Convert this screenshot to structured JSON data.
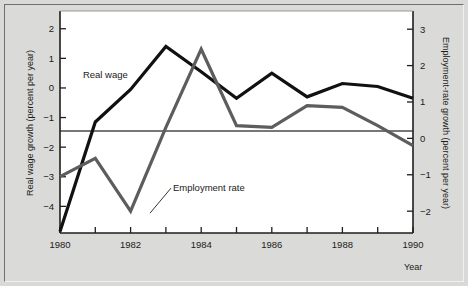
{
  "chart_data": {
    "type": "line",
    "title": "",
    "xlabel": "Year",
    "ylabel_left": "Real wage growth (percent per year)",
    "ylabel_right": "Employment-rate growth (percent per year)",
    "x": [
      1980,
      1981,
      1982,
      1983,
      1984,
      1985,
      1986,
      1987,
      1988,
      1989,
      1990
    ],
    "xlim": [
      1980,
      1990
    ],
    "xticks": [
      1980,
      1981,
      1982,
      1983,
      1984,
      1985,
      1986,
      1987,
      1988,
      1989,
      1990
    ],
    "xticklabels": [
      "1980",
      "",
      "1982",
      "",
      "1984",
      "",
      "1986",
      "",
      "1988",
      "",
      "1990"
    ],
    "ylim_left": [
      -4.9,
      2.6
    ],
    "yticks_left": [
      -4,
      -3,
      -2,
      -1,
      0,
      1,
      2
    ],
    "yticklabels_left": [
      "−4",
      "−3",
      "−2",
      "−1",
      "0",
      "1",
      "2"
    ],
    "ylim_right": [
      -2.6,
      3.5
    ],
    "yticks_right": [
      -2,
      -1,
      0,
      1,
      2,
      3
    ],
    "yticklabels_right": [
      "−2",
      "−1",
      "0",
      "1",
      "2",
      "3"
    ],
    "grid": false,
    "legend_position": "inline-annotations",
    "zero_reference_line": 0,
    "series": [
      {
        "name": "Real wage",
        "axis": "left",
        "color": "#111111",
        "width": 3.2,
        "label_x": 1980.65,
        "label_y_left": 0.35,
        "values": [
          -4.85,
          -1.15,
          -0.05,
          1.4,
          0.55,
          -0.35,
          0.5,
          -0.3,
          0.15,
          0.05,
          -0.35
        ]
      },
      {
        "name": "Employment rate",
        "axis": "right",
        "color": "#5d5d5d",
        "width": 3.2,
        "label_x": 1983.2,
        "label_y_right": -1.45,
        "values": [
          -1.05,
          -0.55,
          -2.0,
          0.3,
          2.45,
          0.35,
          0.3,
          0.9,
          0.85,
          0.35,
          -0.2
        ]
      }
    ],
    "annotations": [
      {
        "text": "Real wage",
        "target_x": 1981.6,
        "target_y_left": -0.45
      },
      {
        "text": "Employment rate",
        "target_x": 1982.55,
        "target_y_right": -2.0
      }
    ]
  },
  "figure": {
    "background_color": "#d9d9d7",
    "plot_background_color": "#ffffff",
    "axis_color": "#2a2a2a"
  }
}
